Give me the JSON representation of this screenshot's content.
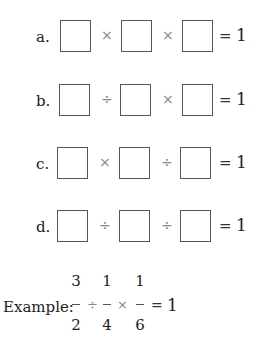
{
  "problems": [
    {
      "label": "a.",
      "op1": "×",
      "op2": "×",
      "equals": "=",
      "result": "1"
    },
    {
      "label": "b.",
      "op1": "÷",
      "op2": "×",
      "equals": "=",
      "result": "1"
    },
    {
      "label": "c.",
      "op1": "×",
      "op2": "÷",
      "equals": "=",
      "result": "1"
    },
    {
      "label": "d.",
      "op1": "÷",
      "op2": "÷",
      "equals": "=",
      "result": "1"
    }
  ],
  "example": {
    "label": "Example:",
    "fractions": [
      {
        "numerator": "3",
        "denominator": "2"
      },
      {
        "numerator": "1",
        "denominator": "4"
      },
      {
        "numerator": "1",
        "denominator": "6"
      }
    ],
    "op1": "÷",
    "op2": "×",
    "equals": "=",
    "result": "1"
  }
}
